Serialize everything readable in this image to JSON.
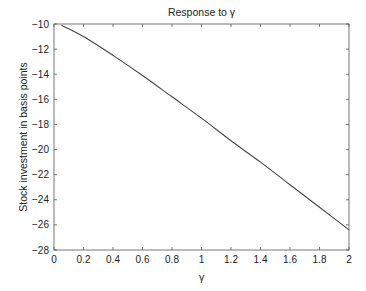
{
  "chart_data": {
    "type": "line",
    "title": "Response to γ",
    "xlabel": "γ",
    "ylabel": "Stock investment in basis points",
    "xlim": [
      0,
      2
    ],
    "ylim": [
      -28,
      -10
    ],
    "xticks": [
      0,
      0.2,
      0.4,
      0.6,
      0.8,
      1,
      1.2,
      1.4,
      1.6,
      1.8,
      2
    ],
    "xtick_labels": [
      "0",
      "0.2",
      "0.4",
      "0.6",
      "0.8",
      "1",
      "1.2",
      "1.4",
      "1.6",
      "1.8",
      "2"
    ],
    "yticks": [
      -10,
      -12,
      -14,
      -16,
      -18,
      -20,
      -22,
      -24,
      -26,
      -28
    ],
    "ytick_labels": [
      "−10",
      "−12",
      "−14",
      "−16",
      "−18",
      "−20",
      "−22",
      "−24",
      "−26",
      "−28"
    ],
    "grid": false,
    "legend": null,
    "series": [
      {
        "name": "Stock investment",
        "color": "#444444",
        "x": [
          0.05,
          0.2,
          0.4,
          0.6,
          0.8,
          1.0,
          1.2,
          1.4,
          1.6,
          1.8,
          2.0
        ],
        "values": [
          -10.1,
          -11.0,
          -12.5,
          -14.1,
          -15.8,
          -17.5,
          -19.3,
          -21.0,
          -22.8,
          -24.6,
          -26.4
        ]
      }
    ]
  }
}
